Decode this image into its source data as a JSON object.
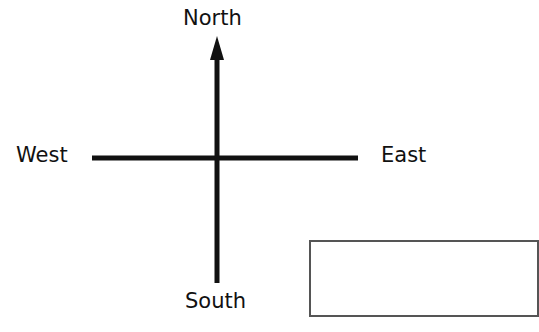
{
  "diagram": {
    "directions": {
      "north": "North",
      "south": "South",
      "east": "East",
      "west": "West"
    },
    "answer_box": {
      "value": ""
    },
    "colors": {
      "lines": "#111111",
      "text": "#111111",
      "box_border": "#555555",
      "background": "#ffffff"
    }
  }
}
